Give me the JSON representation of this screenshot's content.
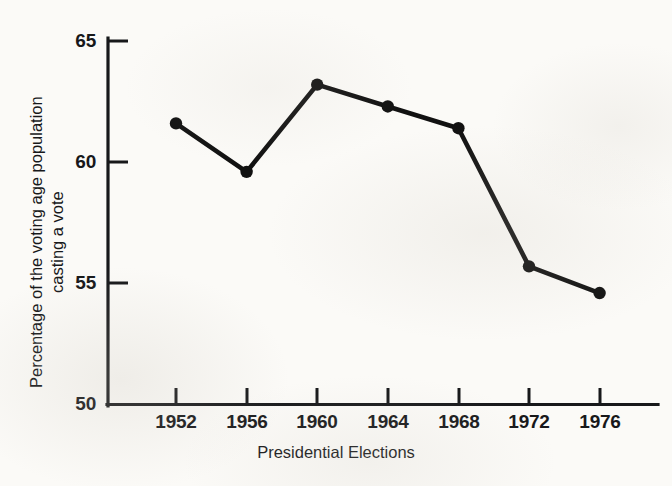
{
  "chart_data": {
    "type": "line",
    "title": "",
    "subtitle": "",
    "xlabel": "Presidential Elections",
    "ylabel": "Percentage of the voting age population casting a vote",
    "ylabel_lines": [
      "Percentage of the voting age population",
      "casting a vote"
    ],
    "categories": [
      "1952",
      "1956",
      "1960",
      "1964",
      "1968",
      "1972",
      "1976"
    ],
    "x": [
      1952,
      1956,
      1960,
      1964,
      1968,
      1972,
      1976
    ],
    "values": [
      61.6,
      59.6,
      63.2,
      62.3,
      61.4,
      55.7,
      54.6
    ],
    "series": [
      {
        "name": "Voter turnout",
        "values": [
          61.6,
          59.6,
          63.2,
          62.3,
          61.4,
          55.7,
          54.6
        ]
      }
    ],
    "ylim": [
      50,
      65
    ],
    "yticks": [
      50,
      55,
      60,
      65
    ],
    "ytick_labels": [
      "50",
      "55",
      "60",
      "65"
    ],
    "xtick_labels": [
      "1952",
      "1956",
      "1960",
      "1964",
      "1968",
      "1972",
      "1976"
    ],
    "grid": false,
    "legend": false,
    "legend_position": "none",
    "marker": "filled-circle",
    "line_color": "#111111",
    "marker_color": "#111111",
    "background_color": "#fbfaf7",
    "annotations": []
  },
  "axes": {
    "y_tick_labels": [
      "65",
      "60",
      "55",
      "50"
    ],
    "x_tick_labels": [
      "1952",
      "1956",
      "1960",
      "1964",
      "1968",
      "1972",
      "1976"
    ],
    "y_title_line1": "Percentage of the voting age population",
    "y_title_line2": "casting a vote",
    "x_title": "Presidential Elections"
  }
}
